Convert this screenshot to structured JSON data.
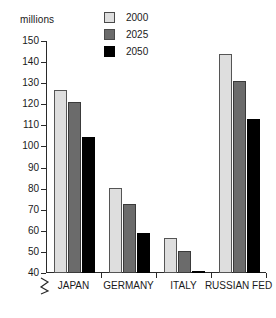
{
  "chart_data": {
    "type": "bar",
    "title": "",
    "xlabel": "",
    "ylabel": "millions",
    "ylim": [
      40,
      150
    ],
    "ytick_values": [
      40,
      50,
      60,
      70,
      80,
      90,
      100,
      110,
      120,
      130,
      140,
      150
    ],
    "ytick_labels": [
      "40",
      "50",
      "60",
      "70",
      "80",
      "90",
      "100",
      "110",
      "120",
      "130",
      "140",
      "150"
    ],
    "axis_break": true,
    "grid": false,
    "legend_position": "top-center",
    "categories": [
      "JAPAN",
      "GERMANY",
      "ITALY",
      "RUSSIAN FED"
    ],
    "series": [
      {
        "name": "2000",
        "color": "#dedede",
        "values": [
          127,
          80.5,
          56.5,
          144
        ]
      },
      {
        "name": "2025",
        "color": "#6b6b6b",
        "values": [
          121,
          72.5,
          50.5,
          131
        ]
      },
      {
        "name": "2050",
        "color": "#000000",
        "values": [
          104.5,
          59,
          40.5,
          113
        ]
      }
    ]
  },
  "axis": {
    "unit_label": "millions"
  },
  "legend": {
    "items": [
      {
        "label": "2000",
        "swatch": "legend-swatch-2000"
      },
      {
        "label": "2025",
        "swatch": "legend-swatch-2025"
      },
      {
        "label": "2050",
        "swatch": "legend-swatch-2050"
      }
    ]
  }
}
